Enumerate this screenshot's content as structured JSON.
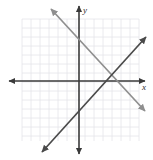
{
  "figure": {
    "type": "coordinate-plane-two-lines",
    "background_color": "#ffffff"
  },
  "grid": {
    "color": "#e4e4ea",
    "cell_size_px": 9,
    "left_px": 22,
    "top_px": 19,
    "right_px": 139,
    "bottom_px": 141,
    "columns": 13,
    "rows": 13,
    "visible": true
  },
  "axes": {
    "color": "#3a3a3a",
    "x_axis": {
      "label": "x",
      "y_px": 81,
      "start_px": 9,
      "end_px": 145,
      "arrows": "both"
    },
    "y_axis": {
      "label": "y",
      "x_px": 79,
      "start_px": 6,
      "end_px": 154,
      "arrows": "both"
    },
    "origin_px": {
      "x": 79,
      "y": 81
    }
  },
  "lines": [
    {
      "name": "ascending-line",
      "color": "#4a4a4a",
      "width_px": 1.7,
      "arrows": "both",
      "from_px": {
        "x": 42,
        "y": 152
      },
      "to_px": {
        "x": 146,
        "y": 37
      },
      "slope_approx": 1.1,
      "direction": "rising left-to-right"
    },
    {
      "name": "descending-line",
      "color": "#8f8f8f",
      "width_px": 1.7,
      "arrows": "both",
      "from_px": {
        "x": 51,
        "y": 9
      },
      "to_px": {
        "x": 145,
        "y": 111
      },
      "slope_approx": -1.09,
      "direction": "falling left-to-right"
    }
  ],
  "intersection": {
    "label": "",
    "x_px": 110,
    "y_px": 75,
    "visible_marker": false
  }
}
